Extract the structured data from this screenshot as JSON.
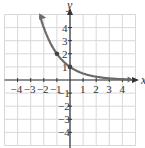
{
  "chart_data": {
    "type": "line",
    "title": "",
    "function": "y = (1/2)^x",
    "xlabel": "x",
    "ylabel": "y",
    "xlim": [
      -5,
      5
    ],
    "ylim": [
      -5,
      5
    ],
    "grid": true,
    "x_ticks": [
      "-4",
      "-3",
      "-2",
      "-1",
      "1",
      "2",
      "3",
      "4"
    ],
    "y_ticks": [
      "4",
      "3",
      "2",
      "1",
      "-1",
      "-2",
      "-3",
      "-4"
    ],
    "series": [
      {
        "name": "curve",
        "x": [
          -2.3,
          -2,
          -1,
          0,
          1,
          2,
          3,
          4,
          4.5
        ],
        "y": [
          4.92,
          4,
          2,
          1,
          0.5,
          0.25,
          0.125,
          0.0625,
          0.044
        ]
      }
    ],
    "marked_points": [
      [
        -1,
        2
      ],
      [
        0,
        1
      ]
    ],
    "colors": {
      "curve": "#6b6b6b",
      "grid": "#d8d8d8",
      "axes": "#333333"
    }
  },
  "labels": {
    "x": "x",
    "y": "y"
  }
}
